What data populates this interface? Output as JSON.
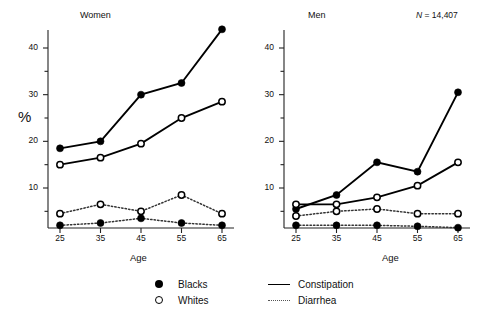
{
  "figure": {
    "y_axis_label": "%",
    "x_axis_label_left": "Age",
    "x_axis_label_right": "Age",
    "panel_left_title": "Women",
    "panel_right_title": "Men",
    "n_annotation_prefix": "N",
    "n_annotation_value": " = 14,407"
  },
  "legend": {
    "items": [
      {
        "label": "Blacks",
        "marker": "filled-circle-icon"
      },
      {
        "label": "Whites",
        "marker": "open-circle-icon"
      },
      {
        "label": "Constipation",
        "marker": "solid-line-icon"
      },
      {
        "label": "Diarrhea",
        "marker": "dotted-line-icon"
      }
    ]
  },
  "axis": {
    "y_ticks_major": [
      "10",
      "20",
      "30",
      "40"
    ],
    "x_ticks": [
      "25",
      "35",
      "45",
      "55",
      "65"
    ]
  },
  "chart_data": [
    {
      "type": "line",
      "title": "Women",
      "xlabel": "Age",
      "ylabel": "%",
      "x": [
        25,
        35,
        45,
        55,
        65
      ],
      "xlim": [
        20,
        70
      ],
      "ylim": [
        0,
        46
      ],
      "yticks": [
        10,
        20,
        30,
        40
      ],
      "grid": false,
      "legend_position": "below-figure",
      "series": [
        {
          "name": "Blacks, Constipation",
          "race": "Blacks",
          "symptom": "Constipation",
          "marker": "filled-circle",
          "line": "solid",
          "values": [
            18.5,
            20.0,
            30.0,
            32.5,
            44.0
          ]
        },
        {
          "name": "Whites, Constipation",
          "race": "Whites",
          "symptom": "Constipation",
          "marker": "open-circle",
          "line": "solid",
          "values": [
            15.0,
            16.5,
            19.5,
            25.0,
            28.5
          ]
        },
        {
          "name": "Whites, Diarrhea",
          "race": "Whites",
          "symptom": "Diarrhea",
          "marker": "open-circle",
          "line": "dotted",
          "values": [
            4.5,
            6.5,
            5.0,
            8.5,
            4.5
          ]
        },
        {
          "name": "Blacks, Diarrhea",
          "race": "Blacks",
          "symptom": "Diarrhea",
          "marker": "filled-circle",
          "line": "dotted",
          "values": [
            2.0,
            2.5,
            3.5,
            2.5,
            2.0
          ]
        }
      ]
    },
    {
      "type": "line",
      "title": "Men",
      "xlabel": "Age",
      "ylabel": "%",
      "annotation": "N = 14,407",
      "x": [
        25,
        35,
        45,
        55,
        65
      ],
      "xlim": [
        20,
        70
      ],
      "ylim": [
        0,
        46
      ],
      "yticks": [
        10,
        20,
        30,
        40
      ],
      "grid": false,
      "legend_position": "below-figure",
      "series": [
        {
          "name": "Blacks, Constipation",
          "race": "Blacks",
          "symptom": "Constipation",
          "marker": "filled-circle",
          "line": "solid",
          "values": [
            5.5,
            8.5,
            15.5,
            13.5,
            30.5
          ]
        },
        {
          "name": "Whites, Constipation",
          "race": "Whites",
          "symptom": "Constipation",
          "marker": "open-circle",
          "line": "solid",
          "values": [
            6.5,
            6.5,
            8.0,
            10.5,
            15.5
          ]
        },
        {
          "name": "Whites, Diarrhea",
          "race": "Whites",
          "symptom": "Diarrhea",
          "marker": "open-circle",
          "line": "dotted",
          "values": [
            4.0,
            5.0,
            5.5,
            4.5,
            4.5
          ]
        },
        {
          "name": "Blacks, Diarrhea",
          "race": "Blacks",
          "symptom": "Diarrhea",
          "marker": "filled-circle",
          "line": "dotted",
          "values": [
            2.0,
            2.0,
            2.0,
            1.8,
            1.5
          ]
        }
      ]
    }
  ]
}
